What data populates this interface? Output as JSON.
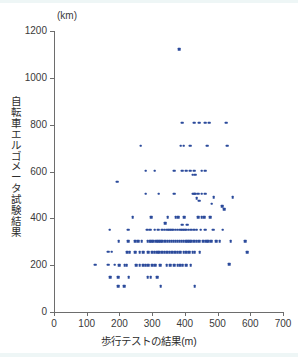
{
  "chart_data": {
    "type": "scatter",
    "title": "",
    "xlabel": "歩行テストの結果(m)",
    "ylabel": "自転車エルゴメータ試験結果",
    "yunit": "(km)",
    "xlim": [
      0,
      700
    ],
    "ylim": [
      0,
      1200
    ],
    "xticks": [
      0,
      100,
      200,
      300,
      400,
      500,
      600,
      700
    ],
    "yticks": [
      0,
      200,
      400,
      600,
      800,
      1000,
      1200
    ],
    "grid": false,
    "legend": null,
    "marker_color": "#2b4a9b",
    "axis_color": "#6d6d6d",
    "points": [
      [
        383,
        1122
      ],
      [
        392,
        808
      ],
      [
        428,
        808
      ],
      [
        443,
        808
      ],
      [
        462,
        808
      ],
      [
        474,
        808
      ],
      [
        526,
        808
      ],
      [
        265,
        710
      ],
      [
        387,
        710
      ],
      [
        396,
        710
      ],
      [
        417,
        710
      ],
      [
        469,
        710
      ],
      [
        530,
        710
      ],
      [
        280,
        604
      ],
      [
        308,
        604
      ],
      [
        368,
        604
      ],
      [
        392,
        604
      ],
      [
        404,
        604
      ],
      [
        416,
        604
      ],
      [
        428,
        604
      ],
      [
        452,
        604
      ],
      [
        462,
        604
      ],
      [
        424,
        586
      ],
      [
        432,
        586
      ],
      [
        194,
        557
      ],
      [
        280,
        505
      ],
      [
        320,
        505
      ],
      [
        368,
        505
      ],
      [
        424,
        505
      ],
      [
        428,
        505
      ],
      [
        432,
        505
      ],
      [
        440,
        505
      ],
      [
        452,
        505
      ],
      [
        462,
        505
      ],
      [
        488,
        490
      ],
      [
        546,
        490
      ],
      [
        436,
        487
      ],
      [
        444,
        476
      ],
      [
        482,
        462
      ],
      [
        515,
        452
      ],
      [
        520,
        440
      ],
      [
        241,
        404
      ],
      [
        298,
        404
      ],
      [
        348,
        404
      ],
      [
        372,
        404
      ],
      [
        380,
        404
      ],
      [
        398,
        404
      ],
      [
        440,
        404
      ],
      [
        452,
        404
      ],
      [
        460,
        404
      ],
      [
        478,
        404
      ],
      [
        340,
        380
      ],
      [
        392,
        372
      ],
      [
        408,
        372
      ],
      [
        170,
        352
      ],
      [
        226,
        352
      ],
      [
        284,
        352
      ],
      [
        294,
        352
      ],
      [
        308,
        352
      ],
      [
        318,
        352
      ],
      [
        330,
        352
      ],
      [
        338,
        352
      ],
      [
        346,
        352
      ],
      [
        352,
        352
      ],
      [
        358,
        352
      ],
      [
        364,
        352
      ],
      [
        372,
        352
      ],
      [
        378,
        352
      ],
      [
        386,
        352
      ],
      [
        392,
        352
      ],
      [
        398,
        352
      ],
      [
        404,
        352
      ],
      [
        412,
        352
      ],
      [
        420,
        352
      ],
      [
        428,
        352
      ],
      [
        436,
        352
      ],
      [
        448,
        352
      ],
      [
        462,
        352
      ],
      [
        486,
        352
      ],
      [
        516,
        352
      ],
      [
        198,
        302
      ],
      [
        226,
        302
      ],
      [
        248,
        302
      ],
      [
        258,
        302
      ],
      [
        268,
        302
      ],
      [
        286,
        302
      ],
      [
        292,
        302
      ],
      [
        298,
        302
      ],
      [
        304,
        302
      ],
      [
        312,
        302
      ],
      [
        318,
        302
      ],
      [
        324,
        302
      ],
      [
        330,
        302
      ],
      [
        340,
        302
      ],
      [
        348,
        302
      ],
      [
        354,
        302
      ],
      [
        360,
        302
      ],
      [
        366,
        302
      ],
      [
        372,
        302
      ],
      [
        378,
        302
      ],
      [
        384,
        302
      ],
      [
        390,
        302
      ],
      [
        396,
        302
      ],
      [
        402,
        302
      ],
      [
        408,
        302
      ],
      [
        414,
        302
      ],
      [
        420,
        302
      ],
      [
        428,
        302
      ],
      [
        436,
        302
      ],
      [
        444,
        302
      ],
      [
        456,
        302
      ],
      [
        466,
        302
      ],
      [
        472,
        302
      ],
      [
        480,
        302
      ],
      [
        496,
        302
      ],
      [
        506,
        302
      ],
      [
        540,
        302
      ],
      [
        584,
        302
      ],
      [
        166,
        258
      ],
      [
        176,
        258
      ],
      [
        224,
        256
      ],
      [
        232,
        256
      ],
      [
        248,
        256
      ],
      [
        262,
        256
      ],
      [
        272,
        256
      ],
      [
        288,
        256
      ],
      [
        300,
        256
      ],
      [
        308,
        256
      ],
      [
        316,
        256
      ],
      [
        322,
        256
      ],
      [
        330,
        256
      ],
      [
        338,
        256
      ],
      [
        346,
        256
      ],
      [
        354,
        256
      ],
      [
        362,
        256
      ],
      [
        370,
        256
      ],
      [
        378,
        256
      ],
      [
        386,
        256
      ],
      [
        396,
        256
      ],
      [
        404,
        256
      ],
      [
        414,
        256
      ],
      [
        424,
        256
      ],
      [
        430,
        256
      ],
      [
        446,
        256
      ],
      [
        590,
        256
      ],
      [
        126,
        202
      ],
      [
        166,
        202
      ],
      [
        186,
        202
      ],
      [
        200,
        200
      ],
      [
        216,
        200
      ],
      [
        222,
        200
      ],
      [
        252,
        200
      ],
      [
        262,
        200
      ],
      [
        272,
        200
      ],
      [
        280,
        200
      ],
      [
        288,
        200
      ],
      [
        300,
        200
      ],
      [
        310,
        200
      ],
      [
        324,
        200
      ],
      [
        344,
        200
      ],
      [
        356,
        200
      ],
      [
        368,
        200
      ],
      [
        378,
        200
      ],
      [
        386,
        200
      ],
      [
        394,
        200
      ],
      [
        404,
        200
      ],
      [
        418,
        200
      ],
      [
        536,
        205
      ],
      [
        172,
        148
      ],
      [
        196,
        148
      ],
      [
        228,
        148
      ],
      [
        286,
        148
      ],
      [
        296,
        148
      ],
      [
        316,
        148
      ],
      [
        196,
        110
      ],
      [
        214,
        110
      ],
      [
        326,
        110
      ],
      [
        430,
        110
      ]
    ]
  }
}
